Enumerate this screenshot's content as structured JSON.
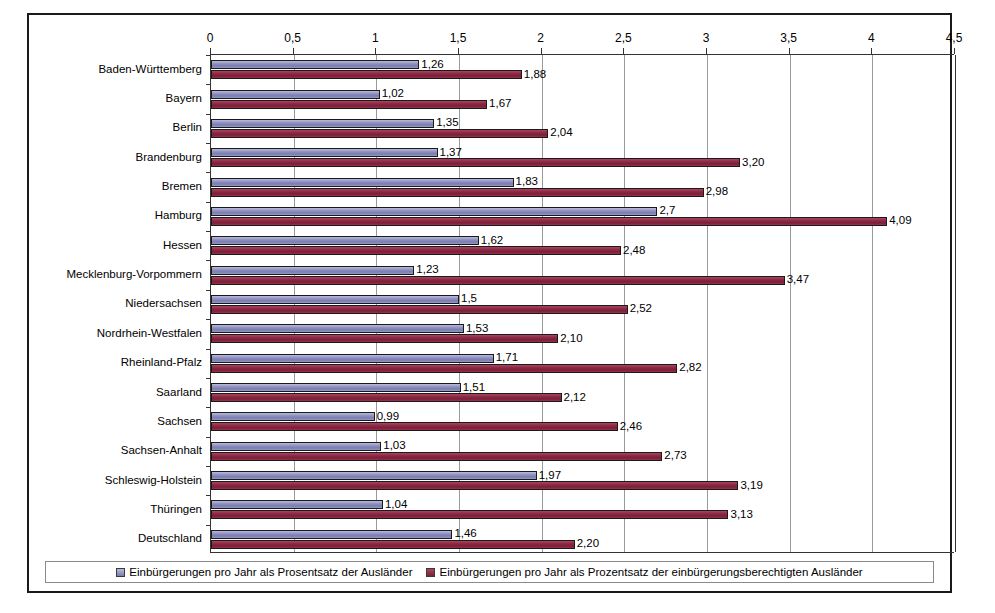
{
  "chart_data": {
    "type": "bar",
    "orientation": "horizontal",
    "title": "",
    "xlabel": "",
    "ylabel": "",
    "xlim": [
      0,
      4.5
    ],
    "xticks": [
      "0",
      "0,5",
      "1",
      "1,5",
      "2",
      "2,5",
      "3",
      "3,5",
      "4",
      "4,5"
    ],
    "xtick_values": [
      0,
      0.5,
      1,
      1.5,
      2,
      2.5,
      3,
      3.5,
      4,
      4.5
    ],
    "grid": true,
    "legend_position": "bottom",
    "categories": [
      "Baden-Württemberg",
      "Bayern",
      "Berlin",
      "Brandenburg",
      "Bremen",
      "Hamburg",
      "Hessen",
      "Mecklenburg-Vorpommern",
      "Niedersachsen",
      "Nordrhein-Westfalen",
      "Rheinland-Pfalz",
      "Saarland",
      "Sachsen",
      "Sachsen-Anhalt",
      "Schleswig-Holstein",
      "Thüringen",
      "Deutschland"
    ],
    "series": [
      {
        "name": "Einbürgerungen pro Jahr als Prosentsatz der Ausländer",
        "color": "#8c8ec0",
        "values": [
          1.26,
          1.02,
          1.35,
          1.37,
          1.83,
          2.7,
          1.62,
          1.23,
          1.5,
          1.53,
          1.71,
          1.51,
          0.99,
          1.03,
          1.97,
          1.04,
          1.46
        ],
        "labels": [
          "1,26",
          "1,02",
          "1,35",
          "1,37",
          "1,83",
          "2,7",
          "1,62",
          "1,23",
          "1,5",
          "1,53",
          "1,71",
          "1,51",
          "0,99",
          "1,03",
          "1,97",
          "1,04",
          "1,46"
        ]
      },
      {
        "name": "Einbürgerungen pro Jahr als Prozentsatz der einbürgerungsberechtigten Ausländer",
        "color": "#8c2843",
        "values": [
          1.88,
          1.67,
          2.04,
          3.2,
          2.98,
          4.09,
          2.48,
          3.47,
          2.52,
          2.1,
          2.82,
          2.12,
          2.46,
          2.73,
          3.19,
          3.13,
          2.2
        ],
        "labels": [
          "1,88",
          "1,67",
          "2,04",
          "3,20",
          "2,98",
          "4,09",
          "2,48",
          "3,47",
          "2,52",
          "2,10",
          "2,82",
          "2,12",
          "2,46",
          "2,73",
          "3,19",
          "3,13",
          "2,20"
        ]
      }
    ]
  },
  "legend": {
    "items": [
      {
        "label": "Einbürgerungen pro Jahr als Prosentsatz der Ausländer",
        "swatch": "s1"
      },
      {
        "label": "Einbürgerungen pro Jahr als Prozentsatz der einbürgerungsberechtigten Ausländer",
        "swatch": "s2"
      }
    ]
  },
  "colors": {
    "series1": "#8c8ec0",
    "series2": "#8c2843",
    "frame": "#1a1a1a",
    "grid": "#9a9a9a",
    "background": "#ffffff"
  }
}
